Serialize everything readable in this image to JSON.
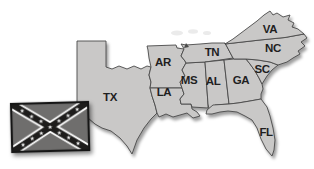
{
  "image": {
    "description": "Grayscale clip-art map of the southern United States (Confederate states) with a Confederate battle flag at lower left",
    "background_color": "#ffffff",
    "state_fill_color": "#c9c8c7",
    "state_border_color": "#4a4a4a",
    "label_color": "#1f1f1f"
  },
  "map": {
    "states": [
      {
        "abbr": "TX"
      },
      {
        "abbr": "AR"
      },
      {
        "abbr": "LA"
      },
      {
        "abbr": "MS"
      },
      {
        "abbr": "TN"
      },
      {
        "abbr": "AL"
      },
      {
        "abbr": "GA"
      },
      {
        "abbr": "SC"
      },
      {
        "abbr": "NC"
      },
      {
        "abbr": "VA"
      },
      {
        "abbr": "FL"
      }
    ]
  },
  "flag": {
    "name": "confederate-battle-flag",
    "field_color": "#6f6e6d",
    "saltire_color": "#1e1d1c",
    "fimbriation_color": "#ffffff",
    "star_color": "#ffffff",
    "star_count": 13,
    "star_glyph": "★"
  }
}
